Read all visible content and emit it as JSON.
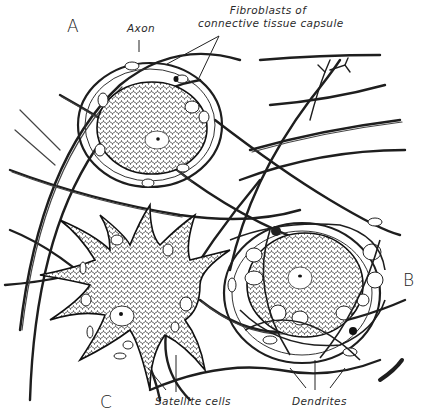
{
  "figure": {
    "panel_letters": {
      "a": "A",
      "b": "B",
      "c": "C"
    },
    "labels": {
      "axon": "Axon",
      "fibroblasts_line1": "Fibroblasts of",
      "fibroblasts_line2": "connective tissue capsule",
      "satellite_cells": "Satellite cells",
      "dendrites": "Dendrites"
    },
    "colors": {
      "ink": "#1e1e1e",
      "background": "#ffffff"
    }
  }
}
